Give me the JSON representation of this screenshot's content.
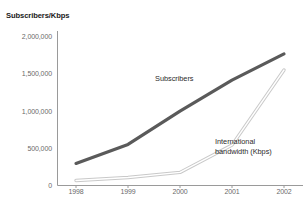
{
  "chart": {
    "cropped_title": "",
    "axis_title": "Subscribers/Kbps"
  },
  "chart_data": {
    "type": "line",
    "title": "",
    "xlabel": "",
    "ylabel": "Subscribers/Kbps",
    "categories": [
      "1998",
      "1999",
      "2000",
      "2001",
      "2002"
    ],
    "x": [
      1998,
      1999,
      2000,
      2001,
      2002
    ],
    "ylim": [
      0,
      2000000
    ],
    "ytick_labels": [
      "2,000,000",
      "1,500,000",
      "1,000,000",
      "500,000",
      "0"
    ],
    "ytick_values": [
      2000000,
      1500000,
      1000000,
      500000,
      0
    ],
    "grid": false,
    "legend": "inline-annotations",
    "series": [
      {
        "name": "Subscribers",
        "color": "#5a5a5a",
        "line_width": 3,
        "values": [
          295000,
          550000,
          995000,
          1410000,
          1760000
        ]
      },
      {
        "name": "International bandwidth (Kbps)",
        "color": "#b9b9b9",
        "line_width": 1,
        "values": [
          67000,
          107000,
          175000,
          540000,
          1545000
        ]
      }
    ],
    "annotations": [
      {
        "text": "Subscribers",
        "series": "Subscribers"
      },
      {
        "text": "International",
        "series": "International bandwidth (Kbps)"
      },
      {
        "text": "bandwidth (Kbps)",
        "series": "International bandwidth (Kbps)"
      }
    ]
  }
}
